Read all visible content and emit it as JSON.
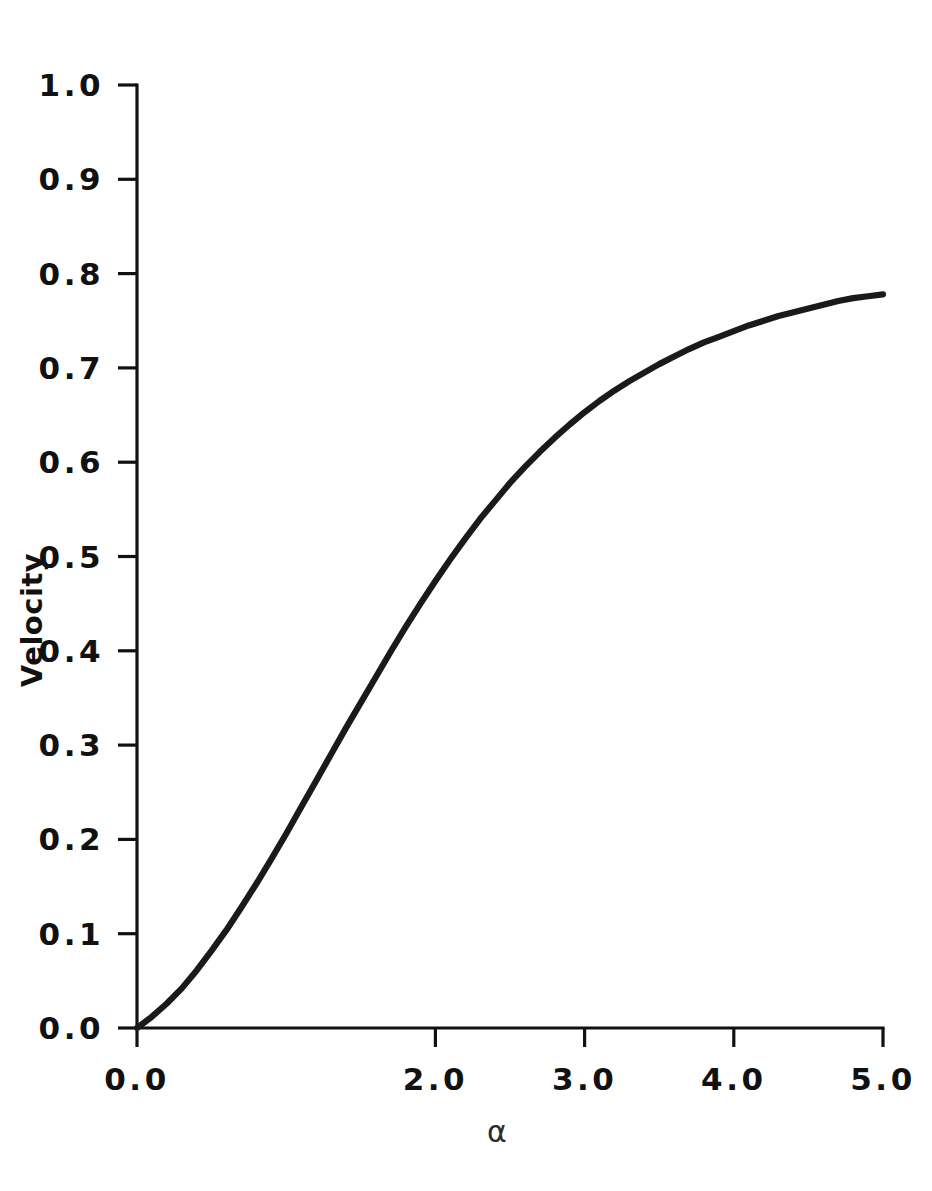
{
  "figure": {
    "background_color": "#ffffff",
    "foreground_color": "#111111",
    "curve_color": "#1a1a1a"
  },
  "labels": {
    "y_axis_title": "Velocity",
    "x_axis_title": "α",
    "y_ticks": [
      "0.0",
      "0.1",
      "0.2",
      "0.3",
      "0.4",
      "0.5",
      "0.6",
      "0.7",
      "0.8",
      "0.9",
      "1.0"
    ],
    "x_ticks": [
      "0.0",
      "2.0",
      "3.0",
      "4.0",
      "5.0"
    ]
  },
  "chart_data": {
    "type": "line",
    "title": "",
    "xlabel": "α",
    "ylabel": "Velocity",
    "xlim": [
      0.0,
      5.0
    ],
    "ylim": [
      0.0,
      1.0
    ],
    "grid": false,
    "legend": "none",
    "x_tick_values": [
      0.0,
      2.0,
      3.0,
      4.0,
      5.0
    ],
    "x_tick_labels": [
      "0.0",
      "2.0",
      "3.0",
      "4.0",
      "5.0"
    ],
    "y_tick_values": [
      0.0,
      0.1,
      0.2,
      0.3,
      0.4,
      0.5,
      0.6,
      0.7,
      0.8,
      0.9,
      1.0
    ],
    "y_tick_labels": [
      "0.0",
      "0.1",
      "0.2",
      "0.3",
      "0.4",
      "0.5",
      "0.6",
      "0.7",
      "0.8",
      "0.9",
      "1.0"
    ],
    "series": [
      {
        "name": "Velocity",
        "x": [
          0.0,
          0.1,
          0.2,
          0.3,
          0.4,
          0.5,
          0.6,
          0.7,
          0.8,
          0.9,
          1.0,
          1.1,
          1.2,
          1.3,
          1.4,
          1.5,
          1.6,
          1.7,
          1.8,
          1.9,
          2.0,
          2.1,
          2.2,
          2.3,
          2.4,
          2.5,
          2.6,
          2.7,
          2.8,
          2.9,
          3.0,
          3.1,
          3.2,
          3.3,
          3.4,
          3.5,
          3.6,
          3.7,
          3.8,
          3.9,
          4.0,
          4.1,
          4.2,
          4.3,
          4.4,
          4.5,
          4.6,
          4.7,
          4.8,
          4.9,
          5.0
        ],
        "y": [
          0.0,
          0.012,
          0.026,
          0.042,
          0.061,
          0.082,
          0.104,
          0.128,
          0.153,
          0.179,
          0.206,
          0.234,
          0.262,
          0.29,
          0.318,
          0.345,
          0.372,
          0.399,
          0.425,
          0.45,
          0.474,
          0.497,
          0.519,
          0.54,
          0.559,
          0.578,
          0.595,
          0.611,
          0.626,
          0.64,
          0.653,
          0.665,
          0.676,
          0.686,
          0.695,
          0.704,
          0.712,
          0.72,
          0.727,
          0.733,
          0.739,
          0.745,
          0.75,
          0.755,
          0.759,
          0.763,
          0.767,
          0.771,
          0.774,
          0.776,
          0.778
        ]
      }
    ]
  },
  "plot_geometry": {
    "left_px": 137,
    "right_px": 883,
    "top_px": 85,
    "bottom_px": 1028
  }
}
